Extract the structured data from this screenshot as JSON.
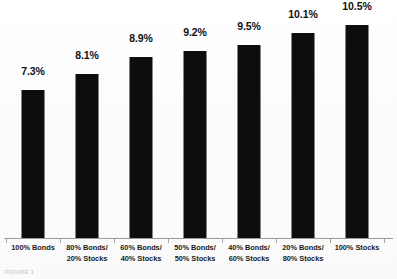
{
  "chart_data": {
    "type": "bar",
    "title": "",
    "subtitle": "",
    "xlabel": "",
    "ylabel": "",
    "ylim": [
      0,
      12.2
    ],
    "grid": false,
    "legend": false,
    "orientation": "vertical",
    "bar_color": "#0d0d0d",
    "background_color": "#ffffff",
    "categories": [
      "100% Bonds",
      "80% Bonds/ 20% Stocks",
      "60% Bonds/ 40% Stocks",
      "50% Bonds/ 50% Stocks",
      "40% Bonds/ 60% Stocks",
      "20% Bonds/ 80% Stocks",
      "100% Stocks"
    ],
    "category_lines": [
      [
        "100% Bonds",
        ""
      ],
      [
        "80% Bonds/",
        "20% Stocks"
      ],
      [
        "60% Bonds/",
        "40% Stocks"
      ],
      [
        "50% Bonds/",
        "50% Stocks"
      ],
      [
        "40% Bonds/",
        "60% Stocks"
      ],
      [
        "20% Bonds/",
        "80% Stocks"
      ],
      [
        "100% Stocks",
        ""
      ]
    ],
    "values": [
      7.3,
      8.1,
      8.9,
      9.2,
      9.5,
      10.1,
      10.5
    ],
    "value_labels": [
      "7.3%",
      "8.1%",
      "8.9%",
      "9.2%",
      "9.5%",
      "10.1%",
      "10.5%"
    ]
  },
  "footer": {
    "caption": "FIGURE 1"
  }
}
